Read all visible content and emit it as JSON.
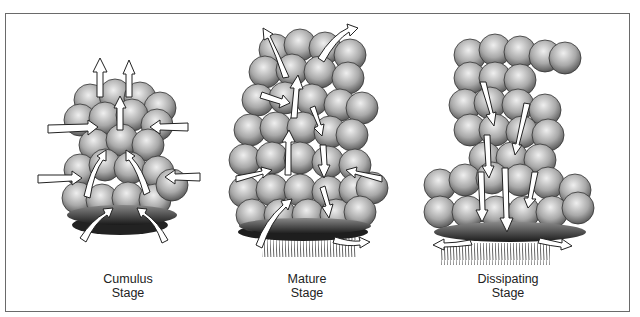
{
  "diagram": {
    "stages": [
      {
        "name": "cumulus",
        "line1": "Cumulus",
        "line2": "Stage"
      },
      {
        "name": "mature",
        "line1": "Mature",
        "line2": "Stage"
      },
      {
        "name": "dissipating",
        "line1": "Dissipating",
        "line2": "Stage"
      }
    ],
    "colors": {
      "frame": "#6a6a6a",
      "cloud_light": "#e6e6e6",
      "cloud_mid": "#a8a8a8",
      "cloud_dark": "#3a3a3a",
      "arrow_fill": "#ffffff",
      "arrow_stroke": "#222222",
      "rain": "#555555"
    }
  }
}
